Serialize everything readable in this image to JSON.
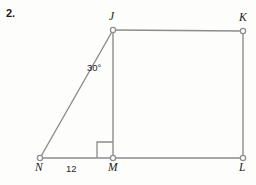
{
  "figure": {
    "problem_number": "2.",
    "stroke_color": "#8c8c8e",
    "background_color": "#fdfdfc",
    "text_color": "#1b1b1b",
    "vertex_fill": "#ffffff"
  },
  "vertices": [
    {
      "name": "J",
      "label": "J",
      "x": 113,
      "y": 30
    },
    {
      "name": "K",
      "label": "K",
      "x": 243,
      "y": 31
    },
    {
      "name": "L",
      "label": "L",
      "x": 243,
      "y": 158
    },
    {
      "name": "M",
      "label": "M",
      "x": 113,
      "y": 158
    },
    {
      "name": "N",
      "label": "N",
      "x": 40,
      "y": 158
    }
  ],
  "labels": {
    "angle_at_J": "30°",
    "side_NM": "12"
  },
  "markers": {
    "right_angle_at_M": true
  },
  "segments": [
    {
      "name": "JK",
      "from": "J",
      "to": "K"
    },
    {
      "name": "KL",
      "from": "K",
      "to": "L"
    },
    {
      "name": "ML",
      "from": "M",
      "to": "L"
    },
    {
      "name": "JM",
      "from": "J",
      "to": "M"
    },
    {
      "name": "NJ",
      "from": "N",
      "to": "J"
    },
    {
      "name": "NM",
      "from": "N",
      "to": "M"
    }
  ]
}
